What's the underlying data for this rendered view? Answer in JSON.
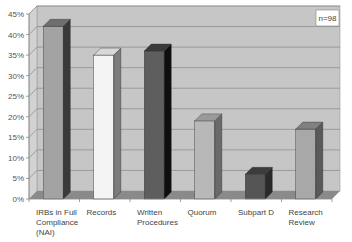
{
  "chart_data": {
    "type": "bar",
    "style": "3d-column",
    "title": "",
    "xlabel": "",
    "ylabel": "",
    "ylim": [
      0,
      45
    ],
    "yticks": [
      "0%",
      "5%",
      "10%",
      "15%",
      "20%",
      "25%",
      "30%",
      "35%",
      "40%",
      "45%"
    ],
    "grid": true,
    "legend": null,
    "annotation": "n=98",
    "categories": [
      [
        "IRBs in Full",
        "Compliance",
        "(NAI)"
      ],
      [
        "Records"
      ],
      [
        "Written",
        "Procedures"
      ],
      [
        "Quorum"
      ],
      [
        "Subpart D"
      ],
      [
        "Research",
        "Review"
      ]
    ],
    "values": [
      42,
      35,
      36,
      19,
      6,
      17
    ],
    "bar_colors": [
      {
        "front": "#a3a3a3",
        "side": "#3a3a3a",
        "top": "#6f6f6f"
      },
      {
        "front": "#f4f4f4",
        "side": "#7c7c7c",
        "top": "#d8d8d8"
      },
      {
        "front": "#5e5e5e",
        "side": "#0e0e0e",
        "top": "#3a3a3a"
      },
      {
        "front": "#b8b8b8",
        "side": "#6a6a6a",
        "top": "#9a9a9a"
      },
      {
        "front": "#555555",
        "side": "#2a2a2a",
        "top": "#3c3c3c"
      },
      {
        "front": "#a8a8a8",
        "side": "#5a5a5a",
        "top": "#808080"
      }
    ]
  },
  "colors": {
    "plot_background": "#c6c6c6",
    "side_wall": "#d2d2d2",
    "floor": "#8a8a8a",
    "gridline": "#8f8f8f",
    "axis": "#888888"
  }
}
